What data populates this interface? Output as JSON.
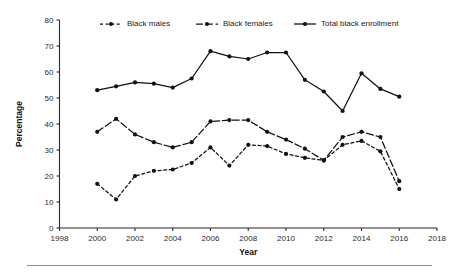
{
  "chart_data": {
    "type": "line",
    "title": "",
    "subtitle": "",
    "xlabel": "Year",
    "ylabel": "Percentage",
    "xlim": [
      1998,
      2018
    ],
    "ylim": [
      0,
      80
    ],
    "xticks": [
      1998,
      2000,
      2002,
      2004,
      2006,
      2008,
      2010,
      2012,
      2014,
      2016,
      2018
    ],
    "yticks": [
      0,
      10,
      20,
      30,
      40,
      50,
      60,
      70,
      80
    ],
    "grid": false,
    "legend_position": "top-center",
    "x": [
      2000,
      2001,
      2002,
      2003,
      2004,
      2005,
      2006,
      2007,
      2008,
      2009,
      2010,
      2011,
      2012,
      2013,
      2014,
      2015,
      2016
    ],
    "series": [
      {
        "name": "Black males",
        "style": "dashed-dotted",
        "marker": "circle",
        "values": [
          17,
          11,
          20,
          22,
          22.5,
          25,
          31,
          24,
          32,
          31.5,
          28.5,
          27,
          26,
          32,
          33.5,
          29.5,
          15
        ]
      },
      {
        "name": "Black females",
        "style": "dash-dot",
        "marker": "circle",
        "values": [
          37,
          42,
          36,
          33,
          31,
          33,
          41,
          41.5,
          41.5,
          37,
          34,
          30.5,
          26,
          35,
          37,
          35,
          18
        ]
      },
      {
        "name": "Total black enrollment",
        "style": "solid",
        "marker": "circle",
        "values": [
          53,
          54.5,
          56,
          55.5,
          54,
          57.5,
          68,
          66,
          65,
          67.5,
          67.5,
          57,
          52.5,
          45,
          59.5,
          53.5,
          50.5
        ]
      }
    ],
    "series_extra_last": {
      "Black males": 15,
      "Black females": 18,
      "Total black enrollment": 33.5
    },
    "legend": [
      "Black males",
      "Black females",
      "Total black enrollment"
    ],
    "colors": {
      "ink": "#111111",
      "axis": "#2b2b2b",
      "background": "#ffffff",
      "rule": "#8a8a8a"
    }
  }
}
